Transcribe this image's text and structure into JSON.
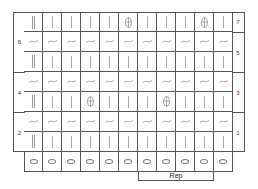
{
  "chart": {
    "left_labels": [
      {
        "text": "6",
        "rows": [
          7,
          5
        ]
      },
      {
        "text": "4",
        "rows": [
          4,
          3
        ]
      },
      {
        "text": "2",
        "rows": [
          2,
          1
        ]
      }
    ],
    "right_labels": [
      {
        "text": "7",
        "rows": [
          7,
          7
        ]
      },
      {
        "text": "5",
        "rows": [
          6,
          5
        ]
      },
      {
        "text": "3",
        "rows": [
          4,
          3
        ]
      },
      {
        "text": "1",
        "rows": [
          2,
          1
        ]
      }
    ],
    "rows_top_to_bottom": [
      {
        "row": 7,
        "stitches": [
          "dbar",
          "bar",
          "bar",
          "bar",
          "bar",
          "bobble",
          "bar",
          "bar",
          "bar",
          "bobble",
          "bar"
        ]
      },
      {
        "row": 6,
        "stitches": [
          "wave",
          "wave",
          "wave",
          "wave",
          "wave",
          "wave",
          "wave",
          "wave",
          "wave",
          "wave",
          "wave"
        ]
      },
      {
        "row": 5,
        "stitches": [
          "dbar",
          "bar",
          "bar",
          "bar",
          "bar",
          "bar",
          "bar",
          "bar",
          "bar",
          "bar",
          "bar"
        ]
      },
      {
        "row": 4,
        "stitches": [
          "wave",
          "wave",
          "wave",
          "wave",
          "wave",
          "wave",
          "wave",
          "wave",
          "wave",
          "wave",
          "wave"
        ]
      },
      {
        "row": 3,
        "stitches": [
          "dbar",
          "bar",
          "bar",
          "bobble",
          "bar",
          "bar",
          "bar",
          "bobble",
          "bar",
          "bar",
          "bar"
        ]
      },
      {
        "row": 2,
        "stitches": [
          "wave",
          "wave",
          "wave",
          "wave",
          "wave",
          "wave",
          "wave",
          "wave",
          "wave",
          "wave",
          "wave"
        ]
      },
      {
        "row": 1,
        "stitches": [
          "dbar",
          "bar",
          "bar",
          "bar",
          "bar",
          "bar",
          "bar",
          "bar",
          "bar",
          "bar",
          "bar"
        ]
      },
      {
        "row": 0,
        "stitches": [
          "oval",
          "oval",
          "oval",
          "oval",
          "oval",
          "oval",
          "oval",
          "oval",
          "oval",
          "oval",
          "oval"
        ]
      }
    ],
    "repeat": {
      "label": "Rep",
      "from_col": 7,
      "to_col": 10
    },
    "line_color": "#555555"
  }
}
